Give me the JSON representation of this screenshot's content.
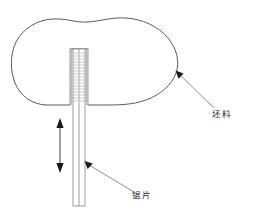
{
  "figure": {
    "title": "",
    "type": "technical-schematic",
    "background_color": "#ffffff",
    "outline_color": "#4a4a4a",
    "blade_color": "#8d8d8d",
    "label_color": "#2b2b2b",
    "arrow_color": "#1a1a1a"
  },
  "labels": {
    "blank": "坯料",
    "saw_blade": "锯片"
  },
  "annotations": [
    {
      "id": "blank",
      "text": "坯料",
      "pointer_from": [
        215,
        110
      ],
      "pointer_to": [
        176,
        72
      ]
    },
    {
      "id": "saw-blade",
      "text": "锯片",
      "pointer_from": [
        135,
        194
      ],
      "pointer_to": [
        85,
        161
      ]
    }
  ],
  "motion": {
    "name": "reciprocating-stroke",
    "direction": "vertical-bidirectional",
    "arrow_top": [
      60,
      120
    ],
    "arrow_bottom": [
      60,
      171
    ]
  },
  "geometry": {
    "blade": {
      "left_x": 73,
      "right_x": 85,
      "top_y": 49,
      "bottom_y": 206
    },
    "slot": {
      "left_x": 70,
      "right_x": 88,
      "top_y": 47,
      "open_y": 105
    },
    "blank_extent": {
      "left_x": 12,
      "right_x": 178,
      "top_y": 18,
      "bottom_y": 107
    },
    "tooth_count": 17
  }
}
